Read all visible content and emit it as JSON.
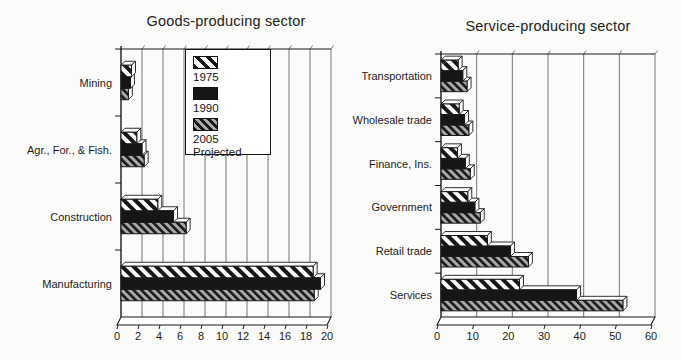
{
  "colors": {
    "background": "#fbfbf9",
    "bar_solid": "#161616",
    "hatch_stripe": "#161616",
    "hatch_1975_bg": "#ffffff",
    "hatch_2005_bg": "#a9a9a9",
    "grid": "#686868",
    "axis": "#1a1a1a",
    "text": "#1c1c1c"
  },
  "chart_data": [
    {
      "type": "bar",
      "orientation": "horizontal",
      "title": "Goods-producing sector",
      "categories": [
        "Mining",
        "Agr., For., & Fish.",
        "Construction",
        "Manufacturing"
      ],
      "series": [
        {
          "name": "1975",
          "pattern": "diagonal-hatch-wide",
          "values": [
            1.0,
            1.5,
            3.5,
            18.3
          ]
        },
        {
          "name": "1990",
          "pattern": "solid-black",
          "values": [
            0.9,
            2.0,
            5.0,
            19.0
          ]
        },
        {
          "name": "2005 Projected",
          "pattern": "diagonal-hatch-gray",
          "values": [
            0.7,
            2.2,
            6.2,
            18.4
          ]
        }
      ],
      "xlim": [
        0,
        20
      ],
      "xticks": [
        0,
        2,
        4,
        6,
        8,
        10,
        12,
        14,
        16,
        18,
        20
      ],
      "grid": true,
      "legend_position": "top-center-inside"
    },
    {
      "type": "bar",
      "orientation": "horizontal",
      "title": "Service-producing sector",
      "categories": [
        "Transportation",
        "Wholesale trade",
        "Finance, Ins.",
        "Government",
        "Retail trade",
        "Services"
      ],
      "series": [
        {
          "name": "1975",
          "pattern": "diagonal-hatch-wide",
          "values": [
            4.8,
            5.1,
            4.6,
            7.5,
            13.0,
            22.0
          ]
        },
        {
          "name": "1990",
          "pattern": "solid-black",
          "values": [
            6.1,
            6.6,
            6.8,
            9.5,
            19.5,
            38.0
          ]
        },
        {
          "name": "2005 Projected",
          "pattern": "diagonal-hatch-gray",
          "values": [
            7.3,
            7.8,
            8.2,
            11.0,
            24.5,
            51.0
          ]
        }
      ],
      "xlim": [
        0,
        60
      ],
      "xticks": [
        0,
        10,
        20,
        30,
        40,
        50,
        60
      ],
      "grid": true
    }
  ]
}
